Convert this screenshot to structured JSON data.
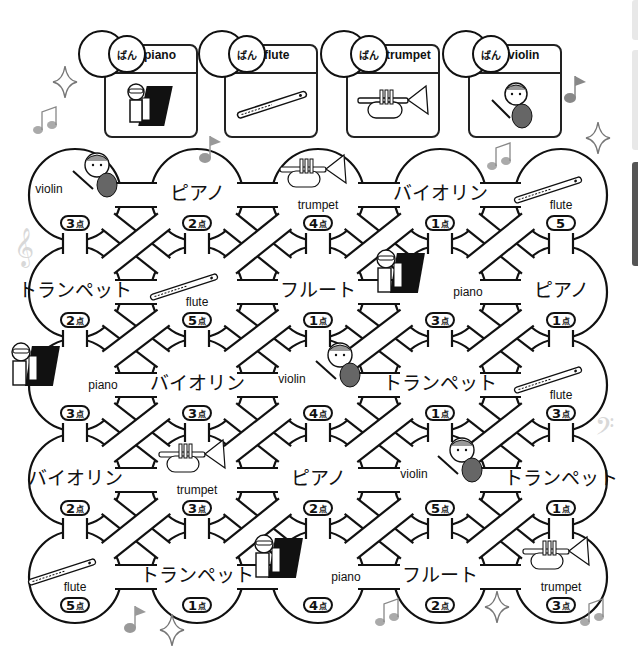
{
  "worksheet": {
    "legend": [
      {
        "ban_label": "ばん",
        "instrument": "piano",
        "picture": "piano-player"
      },
      {
        "ban_label": "ばん",
        "instrument": "flute",
        "picture": "flute"
      },
      {
        "ban_label": "ばん",
        "instrument": "trumpet",
        "picture": "trumpet"
      },
      {
        "ban_label": "ばん",
        "instrument": "violin",
        "picture": "violin-girl"
      }
    ],
    "point_unit": "点",
    "grid": [
      [
        {
          "text": "violin",
          "lang": "en",
          "points": "3",
          "unit": "点",
          "picture": "violin-girl"
        },
        {
          "text": "ピアノ",
          "lang": "jp",
          "points": "2",
          "unit": "点"
        },
        {
          "text": "trumpet",
          "lang": "en",
          "points": "4",
          "unit": "点",
          "picture": "trumpet"
        },
        {
          "text": "バイオリン",
          "lang": "jp",
          "points": "1",
          "unit": "点"
        },
        {
          "text": "flute",
          "lang": "en",
          "points": "5",
          "unit": "",
          "picture": "flute"
        }
      ],
      [
        {
          "text": "トランペット",
          "lang": "jp",
          "points": "2",
          "unit": "点"
        },
        {
          "text": "flute",
          "lang": "en",
          "points": "5",
          "unit": "点",
          "picture": "flute"
        },
        {
          "text": "フルート",
          "lang": "jp",
          "points": "1",
          "unit": "点"
        },
        {
          "text": "piano",
          "lang": "en",
          "points": "3",
          "unit": "点",
          "picture": "piano-player"
        },
        {
          "text": "ピアノ",
          "lang": "jp",
          "points": "1",
          "unit": "点"
        }
      ],
      [
        {
          "text": "piano",
          "lang": "en",
          "points": "3",
          "unit": "点",
          "picture": "piano-player"
        },
        {
          "text": "バイオリン",
          "lang": "jp",
          "points": "3",
          "unit": "点"
        },
        {
          "text": "violin",
          "lang": "en",
          "points": "4",
          "unit": "点",
          "picture": "violin-girl"
        },
        {
          "text": "トランペット",
          "lang": "jp",
          "points": "1",
          "unit": "点"
        },
        {
          "text": "flute",
          "lang": "en",
          "points": "3",
          "unit": "点",
          "picture": "flute"
        }
      ],
      [
        {
          "text": "バイオリン",
          "lang": "jp",
          "points": "2",
          "unit": "点"
        },
        {
          "text": "trumpet",
          "lang": "en",
          "points": "3",
          "unit": "点",
          "picture": "trumpet"
        },
        {
          "text": "ピアノ",
          "lang": "jp",
          "points": "2",
          "unit": "点"
        },
        {
          "text": "violin",
          "lang": "en",
          "points": "5",
          "unit": "点",
          "picture": "violin-girl"
        },
        {
          "text": "トランペット",
          "lang": "jp",
          "points": "1",
          "unit": "点"
        }
      ],
      [
        {
          "text": "flute",
          "lang": "en",
          "points": "5",
          "unit": "点",
          "picture": "flute"
        },
        {
          "text": "トランペット",
          "lang": "jp",
          "points": "1",
          "unit": "点"
        },
        {
          "text": "piano",
          "lang": "en",
          "points": "4",
          "unit": "点",
          "picture": "piano-player"
        },
        {
          "text": "フルート",
          "lang": "jp",
          "points": "2",
          "unit": "点"
        },
        {
          "text": "trumpet",
          "lang": "en",
          "points": "3",
          "unit": "点",
          "picture": "trumpet"
        }
      ]
    ]
  },
  "colors": {
    "line": "#111111",
    "decor": "#8a8a8a",
    "decor_light": "#cfcfcf",
    "tab_active": "#555555",
    "tab_inactive": "#e8e8e8"
  }
}
